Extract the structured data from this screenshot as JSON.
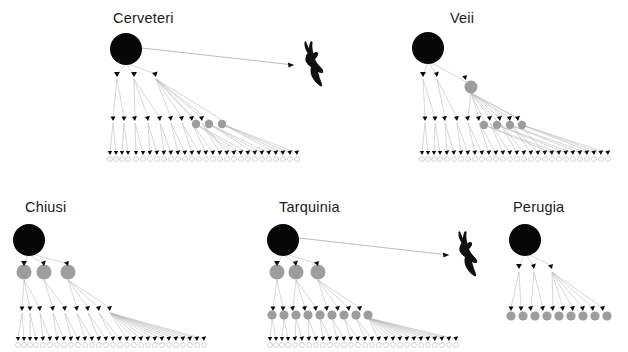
{
  "figure": {
    "type": "network-hierarchy",
    "background_color": "#ffffff",
    "panel_count": 5,
    "colors": {
      "root_node": "#070707",
      "gray_node": "#9d9d9d",
      "leaf_node_fill": "#ffffff",
      "leaf_node_stroke": "#b9b9b9",
      "edge": "#b5b5b5",
      "arrowhead": "#0b0b0b",
      "title_text": "#1a1a1a",
      "blob": "#101010"
    }
  },
  "panels": [
    {
      "id": "cerveteri",
      "title": "Cerveteri",
      "title_x": 113,
      "title_y": 10,
      "origin_x": 0,
      "origin_y": 0,
      "root": {
        "x": 126,
        "y": 49,
        "r": 16
      },
      "has_blob": true,
      "blob": {
        "x": 304,
        "y": 45,
        "w": 24,
        "h": 42
      },
      "blob_arrow": {
        "x1": 142,
        "y1": 48,
        "x2": 295,
        "y2": 65
      },
      "levels": [
        {
          "name": "level-1",
          "y": 76,
          "arrow_nodes": [
            117,
            134,
            156
          ],
          "gray_nodes": []
        },
        {
          "name": "level-2",
          "y": 120,
          "arrow_nodes": [
            113,
            124,
            135,
            148,
            160,
            171,
            182,
            192,
            202
          ],
          "gray_nodes": [
            196,
            209,
            222
          ],
          "gray_r": 4.2
        },
        {
          "name": "level-3",
          "y": 155,
          "arrow_nodes": [
            110,
            116,
            122,
            128,
            136,
            143,
            150,
            157,
            164,
            171,
            178,
            185,
            192,
            199,
            206,
            213,
            220,
            227,
            234,
            241,
            248,
            255,
            262,
            269,
            276,
            283,
            290,
            297
          ],
          "leaf_y": 159,
          "leaf_r": 2.5
        }
      ]
    },
    {
      "id": "veii",
      "title": "Veii",
      "title_x": 450,
      "title_y": 10,
      "origin_x": 0,
      "origin_y": 0,
      "root": {
        "x": 428,
        "y": 48,
        "r": 16
      },
      "has_blob": false,
      "levels": [
        {
          "name": "level-1",
          "y": 76,
          "arrow_nodes": [
            423,
            437
          ],
          "gray_nodes": [
            471
          ],
          "gray_r": 6.5,
          "gray_y": 87
        },
        {
          "name": "level-2",
          "y": 120,
          "arrow_nodes": [
            425,
            435,
            445,
            457,
            468,
            479,
            490,
            500,
            510,
            518
          ],
          "gray_nodes": [
            484,
            497,
            510,
            522
          ],
          "gray_r": 4.2
        },
        {
          "name": "level-3",
          "y": 155,
          "arrow_nodes": [
            422,
            428,
            434,
            440,
            447,
            454,
            461,
            468,
            475,
            482,
            489,
            496,
            503,
            510,
            517,
            524,
            531,
            538,
            545,
            552,
            559,
            566,
            573,
            580,
            587,
            594,
            601,
            608
          ],
          "leaf_y": 159,
          "leaf_r": 2.5
        }
      ]
    },
    {
      "id": "chiusi",
      "title": "Chiusi",
      "title_x": 25,
      "title_y": 199,
      "origin_x": 0,
      "origin_y": 0,
      "root": {
        "x": 29,
        "y": 240,
        "r": 16
      },
      "has_blob": false,
      "levels": [
        {
          "name": "level-1",
          "y": 270,
          "arrow_nodes": [],
          "gray_nodes": [
            24,
            44,
            68
          ],
          "gray_r": 7.5,
          "gray_y": 272
        },
        {
          "name": "level-2",
          "y": 310,
          "arrow_nodes": [
            22,
            30,
            40,
            53,
            65,
            77,
            88,
            99,
            110
          ],
          "gray_nodes": []
        },
        {
          "name": "level-3",
          "y": 341,
          "arrow_nodes": [
            18,
            24,
            30,
            36,
            43,
            50,
            57,
            64,
            71,
            78,
            85,
            92,
            99,
            106,
            113,
            120,
            127,
            134,
            141,
            148,
            155,
            162,
            169,
            176,
            183,
            190,
            197,
            204
          ],
          "leaf_y": 345,
          "leaf_r": 2.5
        }
      ]
    },
    {
      "id": "tarquinia",
      "title": "Tarquinia",
      "title_x": 279,
      "title_y": 199,
      "origin_x": 0,
      "origin_y": 0,
      "root": {
        "x": 283,
        "y": 240,
        "r": 16
      },
      "has_blob": true,
      "blob": {
        "x": 458,
        "y": 232,
        "w": 24,
        "h": 42
      },
      "blob_arrow": {
        "x1": 299,
        "y1": 238,
        "x2": 450,
        "y2": 255
      },
      "levels": [
        {
          "name": "level-1",
          "y": 270,
          "arrow_nodes": [],
          "gray_nodes": [
            277,
            296,
            318
          ],
          "gray_r": 7.5,
          "gray_y": 272
        },
        {
          "name": "level-2",
          "y": 310,
          "arrow_nodes": [
            273,
            283,
            293,
            305,
            316,
            327,
            338,
            349,
            360
          ],
          "gray_nodes": [
            272,
            284,
            296,
            308,
            320,
            332,
            344,
            356,
            368
          ],
          "gray_r": 4.6,
          "gray_y": 313
        },
        {
          "name": "level-3",
          "y": 341,
          "arrow_nodes": [
            270,
            276,
            282,
            288,
            295,
            302,
            309,
            316,
            323,
            330,
            337,
            344,
            351,
            358,
            365,
            372,
            379,
            386,
            393,
            400,
            407,
            414,
            421,
            428,
            435,
            442,
            449,
            456
          ],
          "leaf_y": 345,
          "leaf_r": 2.5
        }
      ]
    },
    {
      "id": "perugia",
      "title": "Perugia",
      "title_x": 513,
      "title_y": 199,
      "origin_x": 0,
      "origin_y": 0,
      "root": {
        "x": 525,
        "y": 240,
        "r": 16
      },
      "has_blob": false,
      "levels": [
        {
          "name": "level-1",
          "y": 268,
          "arrow_nodes": [
            519,
            534,
            552
          ],
          "gray_nodes": []
        },
        {
          "name": "level-2",
          "y": 310,
          "arrow_nodes": [
            511,
            521,
            531,
            543,
            553,
            563,
            573,
            583,
            593,
            603
          ],
          "gray_nodes": [
            511,
            523,
            535,
            547,
            559,
            571,
            583,
            595,
            607
          ],
          "gray_r": 4.6,
          "gray_y": 315
        }
      ]
    }
  ]
}
